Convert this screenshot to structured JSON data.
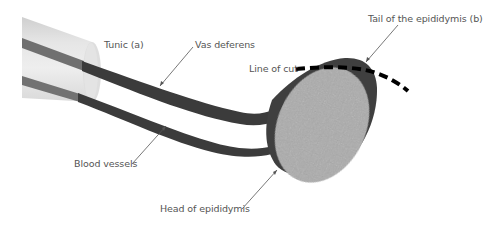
{
  "diagram": {
    "colors": {
      "background": "#ffffff",
      "tunic_light": "#e9e9e9",
      "tunic_mid": "#d2d2d2",
      "tunic_end": "#dcdcdc",
      "vessel_dark": "#3c3c3c",
      "vessel_inside_tunic": "#6e6e6e",
      "epididymis": "#404040",
      "testis": "#a9a9a9",
      "cut_line": "#000000",
      "leader_line": "#555555",
      "label_text": "#555555"
    },
    "labels": {
      "tunic": "Tunic (a)",
      "vas_deferens": "Vas deferens",
      "line_of_cut": "Line of cut",
      "tail_of_epididymis": "Tail of the epididymis (b)",
      "blood_vessels": "Blood vessels",
      "head_of_epididymis": "Head of epididymis"
    }
  }
}
